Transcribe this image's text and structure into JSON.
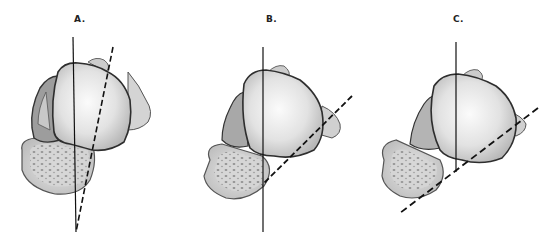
{
  "figure": {
    "panels": [
      {
        "id": "A",
        "label": "A.",
        "label_pos": [
          74,
          14
        ],
        "solid_axis": {
          "x1": 73,
          "y1": 37,
          "x2": 76,
          "y2": 232
        },
        "dashed_axis": {
          "x1": 113,
          "y1": 47,
          "x2": 76,
          "y2": 232
        }
      },
      {
        "id": "B",
        "label": "B.",
        "label_pos": [
          268,
          14
        ],
        "solid_axis": {
          "x1": 263,
          "y1": 47,
          "x2": 263,
          "y2": 232
        },
        "dashed_axis": {
          "x1": 352,
          "y1": 96,
          "x2": 262,
          "y2": 185
        }
      },
      {
        "id": "C",
        "label": "C.",
        "label_pos": [
          455,
          14
        ],
        "solid_axis": {
          "x1": 456,
          "y1": 42,
          "x2": 456,
          "y2": 172
        },
        "dashed_axis": {
          "x1": 538,
          "y1": 108,
          "x2": 400,
          "y2": 213
        }
      }
    ],
    "colors": {
      "background": "#ffffff",
      "line": "#111111",
      "bone_fill_light": "#efefef",
      "bone_fill_mid": "#cfcfcf",
      "bone_fill_dark": "#9a9a9a",
      "outline": "#3a3a3a",
      "cancellous": "#bdbdbd"
    }
  }
}
